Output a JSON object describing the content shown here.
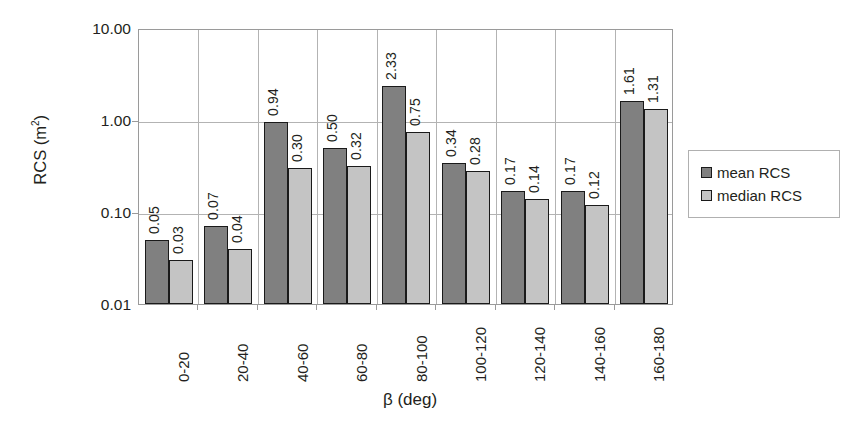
{
  "chart_data": {
    "type": "bar",
    "title": "",
    "xlabel": "β (deg)",
    "ylabel": "RCS (m²)",
    "ylabel_base": "RCS (m",
    "ylabel_sup": "2",
    "ylabel_tail": ")",
    "yscale": "log",
    "ylim": [
      0.01,
      10.0
    ],
    "ytick_labels": [
      "10.00",
      "1.00",
      "0.10",
      "0.01"
    ],
    "ytick_values": [
      10.0,
      1.0,
      0.1,
      0.01
    ],
    "grid": true,
    "legend_position": "right",
    "categories": [
      "0-20",
      "20-40",
      "40-60",
      "60-80",
      "80-100",
      "100-120",
      "120-140",
      "140-160",
      "160-180"
    ],
    "series": [
      {
        "name": "mean RCS",
        "color": "#808080",
        "values": [
          0.05,
          0.07,
          0.94,
          0.5,
          2.33,
          0.34,
          0.17,
          0.17,
          1.61
        ],
        "labels": [
          "0.05",
          "0.07",
          "0.94",
          "0.50",
          "2.33",
          "0.34",
          "0.17",
          "0.17",
          "1.61"
        ]
      },
      {
        "name": "median RCS",
        "color": "#c4c4c4",
        "values": [
          0.03,
          0.04,
          0.3,
          0.32,
          0.75,
          0.28,
          0.14,
          0.12,
          1.31
        ],
        "labels": [
          "0.03",
          "0.04",
          "0.30",
          "0.32",
          "0.75",
          "0.28",
          "0.14",
          "0.12",
          "1.31"
        ]
      }
    ]
  },
  "legend": {
    "entries": [
      {
        "label": "mean RCS",
        "color": "#808080"
      },
      {
        "label": "median RCS",
        "color": "#c4c4c4"
      }
    ]
  }
}
